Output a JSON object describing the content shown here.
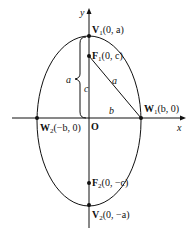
{
  "diagram": {
    "axes": {
      "x_label": "x",
      "y_label": "y",
      "origin_label": "O"
    },
    "points": {
      "V1": {
        "name": "V",
        "sub": "1",
        "coords": "(0, a)"
      },
      "V2": {
        "name": "V",
        "sub": "2",
        "coords": "(0, −a)"
      },
      "F1": {
        "name": "F",
        "sub": "1",
        "coords": "(0, c)"
      },
      "F2": {
        "name": "F",
        "sub": "2",
        "coords": "(0, −c)"
      },
      "W1": {
        "name": "W",
        "sub": "1",
        "coords": "(b, 0)"
      },
      "W2": {
        "name": "W",
        "sub": "2",
        "coords": "(−b, 0)"
      }
    },
    "segment_labels": {
      "brace_a": "a",
      "focal_c": "c",
      "hypotenuse_a": "a",
      "semi_minor_b": "b"
    },
    "colors": {
      "stroke": "#111111",
      "background": "#ffffff"
    }
  }
}
